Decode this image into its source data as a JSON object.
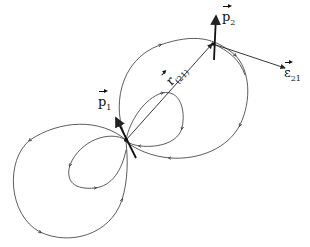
{
  "diagram": {
    "labels": {
      "p1": {
        "symbol": "p",
        "subscript": "1"
      },
      "p2": {
        "symbol": "p",
        "subscript": "2"
      },
      "r21": {
        "symbol": "r",
        "subscript": "(21)"
      },
      "e21": {
        "symbol": "ε",
        "subscript": "21"
      }
    },
    "colors": {
      "stroke": "#222222",
      "background": "#ffffff"
    }
  }
}
